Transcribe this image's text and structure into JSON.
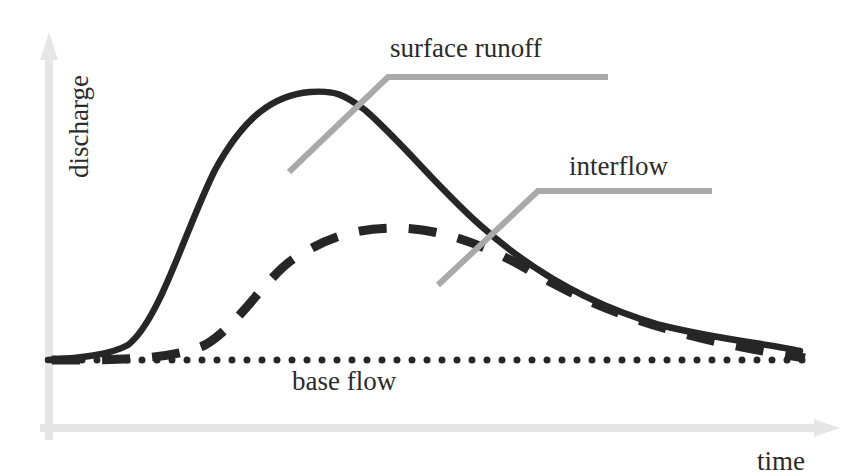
{
  "diagram": {
    "type": "hydrograph",
    "axes": {
      "x_label": "time",
      "y_label": "discharge",
      "color": "#e6e6e6"
    },
    "labels": {
      "surface_runoff": "surface runoff",
      "interflow": "interflow",
      "base_flow": "base flow"
    },
    "series": [
      {
        "name": "surface runoff",
        "style": "solid",
        "color": "#262626"
      },
      {
        "name": "interflow",
        "style": "dashed",
        "color": "#262626"
      },
      {
        "name": "base flow",
        "style": "dotted",
        "color": "#262626"
      }
    ],
    "leader_color": "#a9a9a9"
  }
}
